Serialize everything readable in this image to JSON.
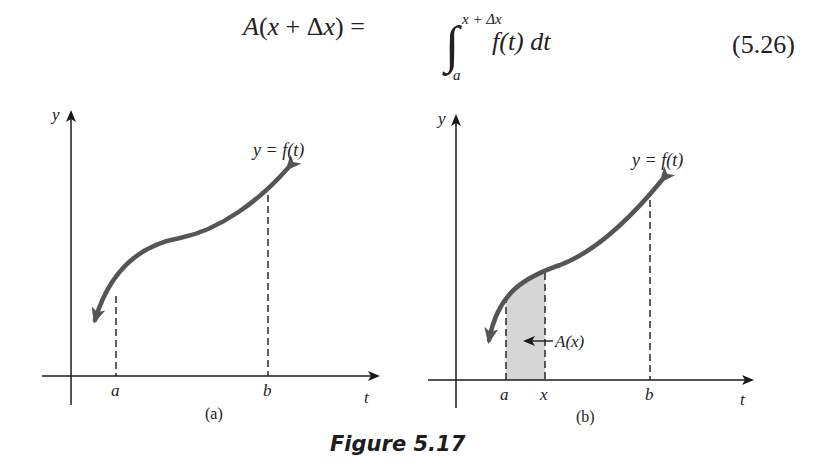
{
  "equation": {
    "lhs": "A(x + Δx) =",
    "integral_upper_limit": "x + Δx",
    "integral_lower_limit": "a",
    "integrand": "f(t) dt",
    "number": "(5.26)"
  },
  "figure_caption": "Figure 5.17",
  "panels": [
    {
      "id": "a",
      "label": "(a)",
      "y_axis_label": "y",
      "x_axis_label": "t",
      "curve_label": "y = f(t)",
      "ticks": [
        "a",
        "b"
      ]
    },
    {
      "id": "b",
      "label": "(b)",
      "y_axis_label": "y",
      "x_axis_label": "t",
      "curve_label": "y = f(t)",
      "ticks": [
        "a",
        "x",
        "b"
      ],
      "shaded_region_label": "A(x)"
    }
  ],
  "colors": {
    "curve": "#555555",
    "axes": "#1a1a1a",
    "shade": "#d6d6d6"
  }
}
